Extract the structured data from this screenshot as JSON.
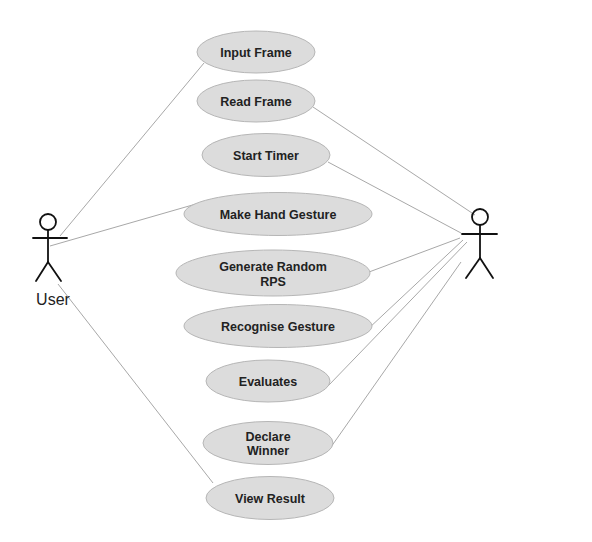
{
  "diagram": {
    "type": "use-case",
    "colors": {
      "usecase_fill": "#dcdcdc",
      "usecase_border": "#b6b6b6",
      "text": "#222222",
      "association": "#a8a8a8",
      "actor": "#111111"
    },
    "actors": [
      {
        "id": "user",
        "label": "User"
      },
      {
        "id": "system",
        "label": ""
      }
    ],
    "use_cases": [
      {
        "id": "input_frame",
        "lines": [
          "Input Frame"
        ],
        "actor": "User"
      },
      {
        "id": "read_frame",
        "lines": [
          "Read Frame"
        ],
        "actor": "System"
      },
      {
        "id": "start_timer",
        "lines": [
          "Start Timer"
        ],
        "actor": "System"
      },
      {
        "id": "make_hand_gesture",
        "lines": [
          "Make Hand Gesture"
        ],
        "actor": "User"
      },
      {
        "id": "generate_random_rps",
        "lines": [
          "Generate Random",
          "RPS"
        ],
        "actor": "System"
      },
      {
        "id": "recognise_gesture",
        "lines": [
          "Recognise Gesture"
        ],
        "actor": "System"
      },
      {
        "id": "evaluates",
        "lines": [
          "Evaluates"
        ],
        "actor": "System"
      },
      {
        "id": "declare_winner",
        "lines": [
          "Declare",
          "Winner"
        ],
        "actor": "System"
      },
      {
        "id": "view_result",
        "lines": [
          "View Result"
        ],
        "actor": "User"
      }
    ]
  }
}
